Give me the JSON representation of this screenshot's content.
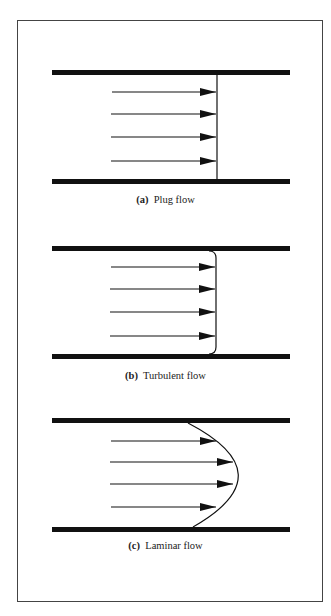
{
  "figure": {
    "panels": [
      {
        "id": "a",
        "label": "(a)",
        "title": "Plug flow",
        "profile": "flat",
        "arrows": 4
      },
      {
        "id": "b",
        "label": "(b)",
        "title": "Turbulent flow",
        "profile": "blunt-rounded",
        "arrows": 4
      },
      {
        "id": "c",
        "label": "(c)",
        "title": "Laminar flow",
        "profile": "parabolic",
        "arrows": 4
      }
    ],
    "colors": {
      "pipe_wall": "#111111",
      "arrow": "#111111",
      "profile_line": "#111111",
      "frame": "#444444",
      "background": "#ffffff"
    }
  }
}
